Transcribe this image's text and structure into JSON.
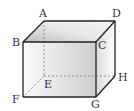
{
  "diagram": {
    "type": "cuboid",
    "vertices": {
      "A": {
        "label": "A",
        "x": 44,
        "y": 21
      },
      "B": {
        "label": "B",
        "x": 23,
        "y": 42
      },
      "C": {
        "label": "C",
        "x": 96,
        "y": 42
      },
      "D": {
        "label": "D",
        "x": 115,
        "y": 21
      },
      "E": {
        "label": "E",
        "x": 44,
        "y": 76
      },
      "F": {
        "label": "F",
        "x": 23,
        "y": 97
      },
      "G": {
        "label": "G",
        "x": 96,
        "y": 97
      },
      "H": {
        "label": "H",
        "x": 115,
        "y": 76
      }
    },
    "visible_edges": [
      "AB",
      "AD",
      "BC",
      "CD",
      "BF",
      "CG",
      "FG",
      "DH",
      "GH"
    ],
    "hidden_edges": [
      "AE",
      "EF",
      "EH"
    ],
    "colors": {
      "edge": "#222222",
      "hidden_edge": "#777777",
      "front_face": "#e6e6e6",
      "top_face": "#d8d8d8",
      "side_face": "#efefef"
    }
  }
}
